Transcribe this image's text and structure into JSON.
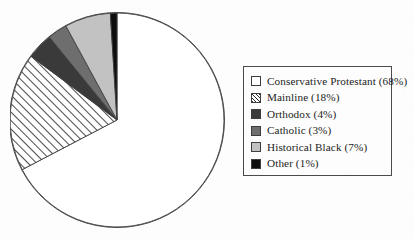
{
  "chart_data": {
    "type": "pie",
    "title": "",
    "subtitle": "",
    "xlabel": "",
    "ylabel": "",
    "legend_position": "right",
    "grid": false,
    "units": "percent",
    "start_angle_deg": 0,
    "direction": "clockwise",
    "categories": [
      "Conservative Protestant",
      "Mainline",
      "Orthodox",
      "Catholic",
      "Historical Black",
      "Other"
    ],
    "values": [
      68,
      18,
      4,
      3,
      7,
      1
    ],
    "slices": [
      {
        "label": "Conservative Protestant",
        "value": 68,
        "value_text": "68%",
        "legend_text": "Conservative Protestant (68%)",
        "fill": "#ffffff",
        "pattern": "solid",
        "swatch_class": "sw-white",
        "start_deg": 0,
        "end_deg": 244.8
      },
      {
        "label": "Mainline",
        "value": 18,
        "value_text": "18%",
        "legend_text": "Mainline (18%)",
        "fill": "#ffffff",
        "pattern": "diagonal-hatch",
        "swatch_class": "sw-hatch",
        "start_deg": 244.8,
        "end_deg": 309.6
      },
      {
        "label": "Orthodox",
        "value": 4,
        "value_text": "4%",
        "legend_text": "Orthodox (4%)",
        "fill": "#3a3a3a",
        "pattern": "solid",
        "swatch_class": "sw-dark",
        "start_deg": 309.6,
        "end_deg": 324.0
      },
      {
        "label": "Catholic",
        "value": 3,
        "value_text": "3%",
        "legend_text": "Catholic (3%)",
        "fill": "#6e6e6e",
        "pattern": "solid",
        "swatch_class": "sw-med",
        "start_deg": 324.0,
        "end_deg": 334.8
      },
      {
        "label": "Historical Black",
        "value": 7,
        "value_text": "7%",
        "legend_text": "Historical Black (7%)",
        "fill": "#c2c2c2",
        "pattern": "solid",
        "swatch_class": "sw-light",
        "start_deg": 334.8,
        "end_deg": 360.0
      },
      {
        "label": "Other",
        "value": 1,
        "value_text": "1%",
        "legend_text": "Other (1%)",
        "fill": "#0d0d0d",
        "pattern": "solid",
        "swatch_class": "sw-black",
        "start_deg": 356.4,
        "end_deg": 360.0
      }
    ]
  },
  "legend": {
    "items": [
      {
        "label": "Conservative Protestant (68%)",
        "swatch_class": "sw-white",
        "swatch_name": "swatch-conservative-protestant"
      },
      {
        "label": "Mainline (18%)",
        "swatch_class": "sw-hatch",
        "swatch_name": "swatch-mainline"
      },
      {
        "label": "Orthodox (4%)",
        "swatch_class": "sw-dark",
        "swatch_name": "swatch-orthodox"
      },
      {
        "label": "Catholic (3%)",
        "swatch_class": "sw-med",
        "swatch_name": "swatch-catholic"
      },
      {
        "label": "Historical Black (7%)",
        "swatch_class": "sw-light",
        "swatch_name": "swatch-historical-black"
      },
      {
        "label": "Other (1%)",
        "swatch_class": "sw-black",
        "swatch_name": "swatch-other"
      }
    ]
  },
  "colors": {
    "background": "#fdfdfd",
    "outline": "#4a4a4a",
    "dark_gray": "#3a3a3a",
    "medium_gray": "#6e6e6e",
    "light_gray": "#c2c2c2",
    "black": "#0d0d0d",
    "white": "#ffffff"
  }
}
